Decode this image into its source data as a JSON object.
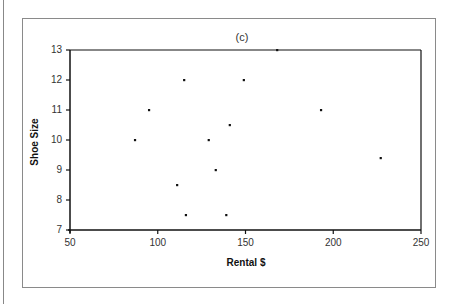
{
  "chart_data": {
    "type": "scatter",
    "title": "(c)",
    "xlabel": "Rental $",
    "ylabel": "Shoe Size",
    "xlim": [
      50,
      250
    ],
    "ylim": [
      7,
      13
    ],
    "xticks": [
      50,
      100,
      150,
      200,
      250
    ],
    "yticks": [
      7,
      8,
      9,
      10,
      11,
      12,
      13
    ],
    "grid": false,
    "legend": null,
    "points": [
      {
        "x": 87,
        "y": 10
      },
      {
        "x": 95,
        "y": 11
      },
      {
        "x": 111,
        "y": 8.5
      },
      {
        "x": 115,
        "y": 12
      },
      {
        "x": 116,
        "y": 7.5
      },
      {
        "x": 129,
        "y": 10
      },
      {
        "x": 133,
        "y": 9
      },
      {
        "x": 139,
        "y": 7.5
      },
      {
        "x": 141,
        "y": 10.5
      },
      {
        "x": 149,
        "y": 12
      },
      {
        "x": 168,
        "y": 13
      },
      {
        "x": 193,
        "y": 11
      },
      {
        "x": 227,
        "y": 9.4
      }
    ]
  },
  "colors": {
    "axis": "#111111",
    "point": "#111111",
    "frame": "#8a8a8a"
  }
}
